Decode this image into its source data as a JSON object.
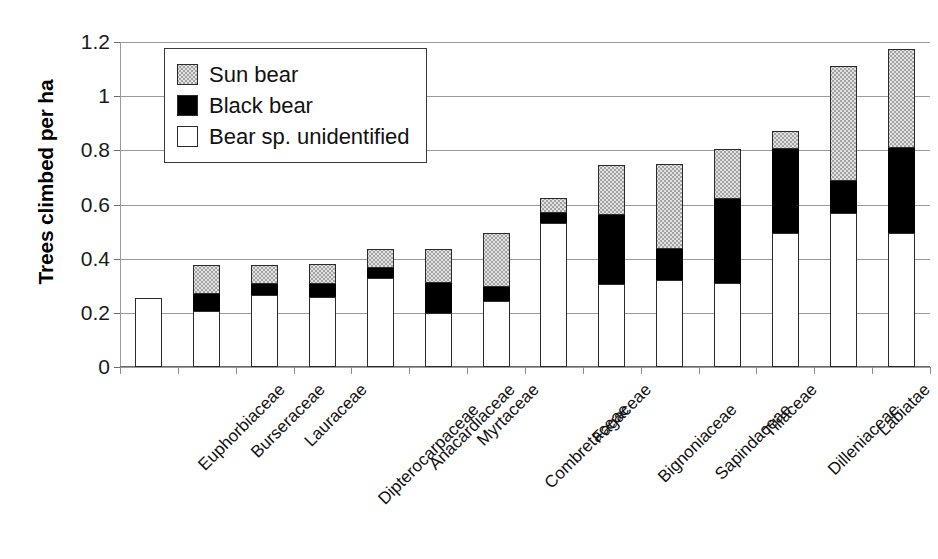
{
  "chart_data": {
    "type": "bar",
    "subtype": "stacked-bar",
    "title": "",
    "xlabel": "",
    "ylabel": "Trees climbed per ha",
    "ylim": [
      0,
      1.2
    ],
    "yticks": [
      0,
      0.2,
      0.4,
      0.6,
      0.8,
      1,
      1.2
    ],
    "ytick_labels": [
      "0",
      "0.2",
      "0.4",
      "0.6",
      "0.8",
      "1",
      "1.2"
    ],
    "grid": true,
    "legend_position": "top-left-inside",
    "categories": [
      "Euphorbiaceae",
      "Burseraceae",
      "Lauraceae",
      "Dipterocarpaceae",
      "Anacardiaceae",
      "Myrtaceae",
      "Combretaceae",
      "Fagaceae",
      "Bignoniaceae",
      "Sapindaceae",
      "Tiliaceae",
      "Dilleniaceae",
      "Labiatae",
      "Leguminosae"
    ],
    "series": [
      {
        "name": "Bear sp. unidentified",
        "color": "#ffffff",
        "values": [
          0.255,
          0.205,
          0.265,
          0.26,
          0.33,
          0.2,
          0.245,
          0.53,
          0.305,
          0.32,
          0.31,
          0.495,
          0.57,
          0.495
        ]
      },
      {
        "name": "Black bear",
        "color": "#000000",
        "values": [
          0.0,
          0.065,
          0.04,
          0.045,
          0.035,
          0.11,
          0.05,
          0.04,
          0.255,
          0.115,
          0.31,
          0.31,
          0.115,
          0.315
        ]
      },
      {
        "name": "Sun bear",
        "color": "#e2e2e2",
        "values": [
          0.0,
          0.105,
          0.07,
          0.075,
          0.07,
          0.125,
          0.2,
          0.055,
          0.185,
          0.315,
          0.185,
          0.065,
          0.425,
          0.365
        ]
      }
    ],
    "totals": [
      0.255,
      0.375,
      0.375,
      0.38,
      0.435,
      0.435,
      0.495,
      0.625,
      0.745,
      0.75,
      0.805,
      0.87,
      1.11,
      1.175
    ]
  },
  "legend": {
    "items": [
      {
        "label": "Sun bear",
        "swatch": "gray"
      },
      {
        "label": "Black bear",
        "swatch": "black"
      },
      {
        "label": "Bear sp. unidentified",
        "swatch": "white"
      }
    ]
  }
}
